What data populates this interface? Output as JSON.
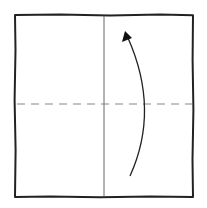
{
  "diagram": {
    "type": "origami-step",
    "paper": {
      "x1": 15,
      "y1": 14,
      "x2": 193,
      "y2": 197,
      "stroke": "#222222",
      "fill": "#ffffff"
    },
    "crease_vertical": {
      "x": 104,
      "y1": 15,
      "y2": 197,
      "stroke": "#555555"
    },
    "fold_line": {
      "style": "dashed",
      "y": 104,
      "x1": 16,
      "x2": 192,
      "stroke": "#888888"
    },
    "arrow": {
      "start": [
        130,
        176
      ],
      "control": [
        158,
        110
      ],
      "end": [
        125,
        32
      ],
      "stroke": "#222222",
      "direction": "up"
    },
    "labels": []
  }
}
